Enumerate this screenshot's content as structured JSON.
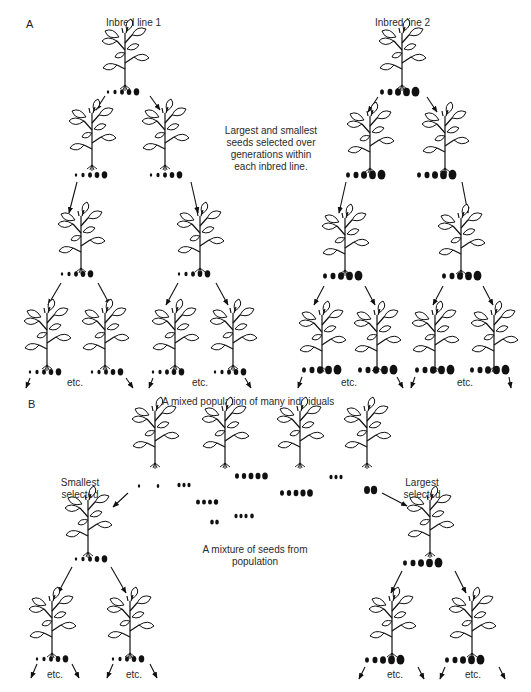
{
  "panel_a": {
    "letter": "A",
    "line1_title": "Inbred line 1",
    "line2_title": "Inbred line 2",
    "note_lines": [
      "Largest and smallest",
      "seeds selected over",
      "generations within",
      "each inbred line."
    ],
    "etc_labels": [
      "etc.",
      "etc.",
      "etc.",
      "etc."
    ]
  },
  "panel_b": {
    "letter": "B",
    "title": "A mixed population of many individuals",
    "smallest_label": [
      "Smallest",
      "selected"
    ],
    "largest_label": [
      "Largest",
      "selected"
    ],
    "mixture_label": [
      "A mixture of seeds from",
      "population"
    ],
    "etc_labels": [
      "etc.",
      "etc.",
      "etc.",
      "etc."
    ]
  },
  "icons": {
    "plant": "bean-plant-icon",
    "seed": "bean-seed-icon",
    "arrow": "arrow-icon"
  },
  "colors": {
    "ink": "#111111",
    "background": "#ffffff"
  }
}
